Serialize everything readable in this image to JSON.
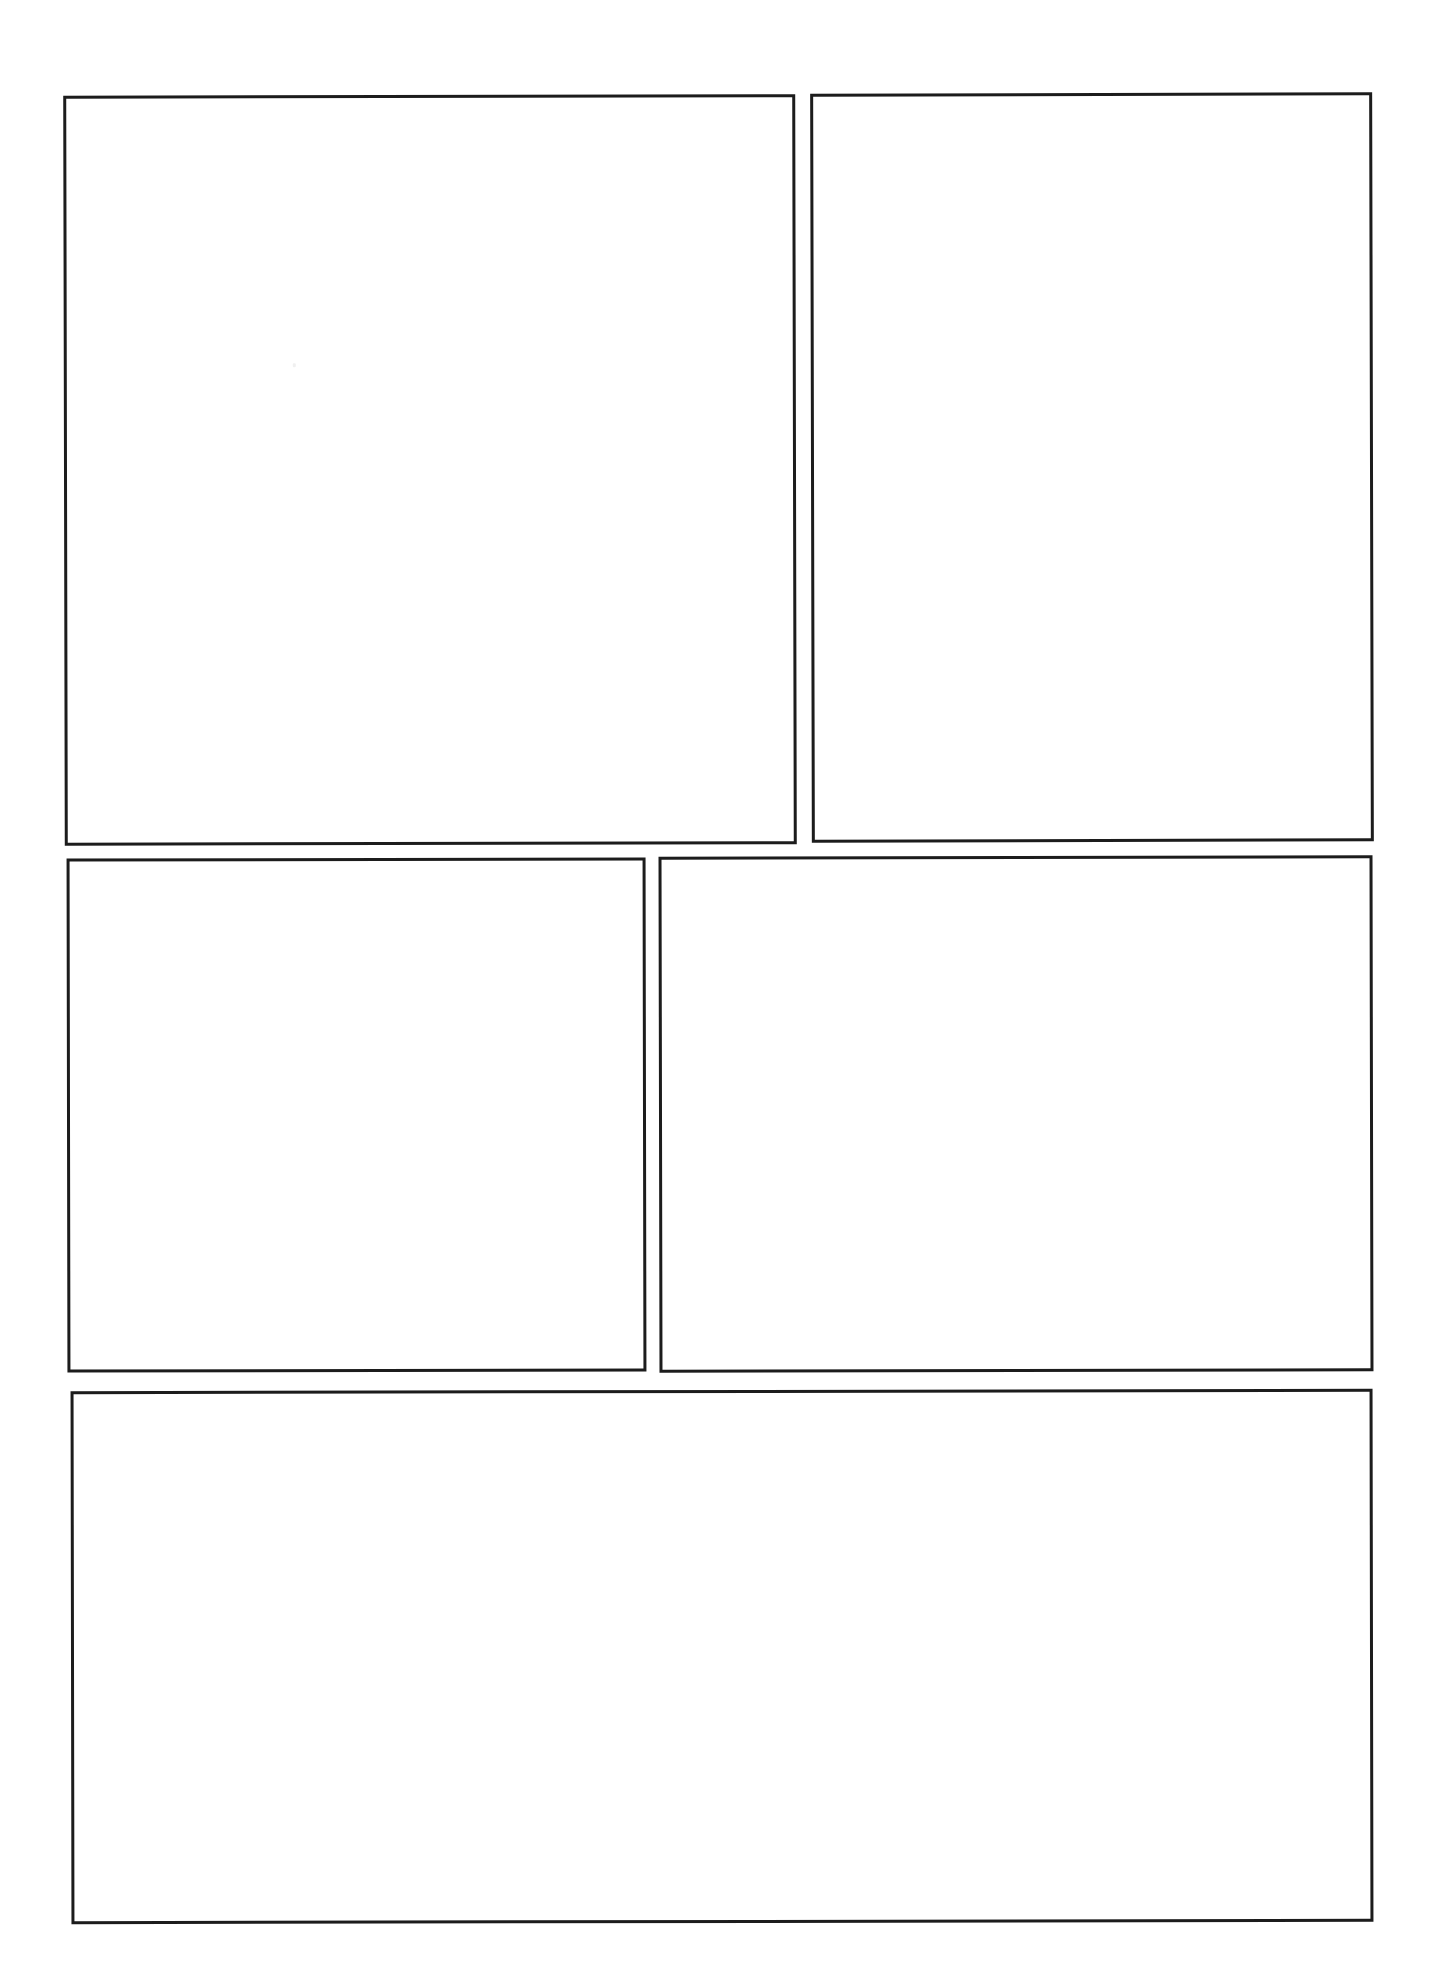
{
  "page": {
    "title": "Blank Comic Page Template",
    "background_color": "#ffffff",
    "border_color": "#1c1c1c",
    "width": 1430,
    "height": 1980
  },
  "panels": [
    {
      "id": "panel-1",
      "label": "",
      "row": 1,
      "column": 1,
      "x": 64,
      "y": 95,
      "width": 732,
      "height": 750,
      "content": "",
      "empty": true
    },
    {
      "id": "panel-2",
      "label": "",
      "row": 1,
      "column": 2,
      "x": 811,
      "y": 93,
      "width": 562,
      "height": 749,
      "content": "",
      "empty": true
    },
    {
      "id": "panel-3",
      "label": "",
      "row": 2,
      "column": 1,
      "x": 67,
      "y": 858,
      "width": 579,
      "height": 514,
      "content": "",
      "empty": true
    },
    {
      "id": "panel-4",
      "label": "",
      "row": 2,
      "column": 2,
      "x": 659,
      "y": 856,
      "width": 714,
      "height": 516,
      "content": "",
      "empty": true
    },
    {
      "id": "panel-5",
      "label": "",
      "row": 3,
      "column": 1,
      "x": 71,
      "y": 1390,
      "width": 1302,
      "height": 533,
      "content": "",
      "empty": true
    }
  ]
}
